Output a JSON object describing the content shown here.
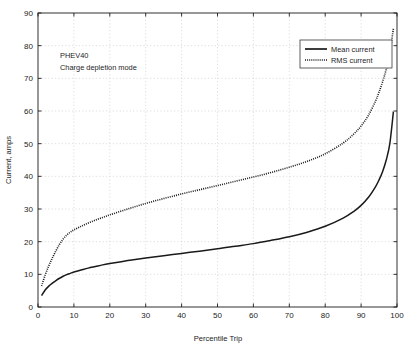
{
  "figure": {
    "background_color": "#ffffff",
    "axis_color": "#1c1c1c",
    "grid_color": "#c8c8c8",
    "series_color": "#1a1a1a"
  },
  "annotation": {
    "line1": "PHEV40",
    "line2": "Charge depletion mode"
  },
  "legend": {
    "position": "top-right",
    "entries": [
      {
        "label": "Mean current",
        "style": "solid"
      },
      {
        "label": "RMS current",
        "style": "dotted"
      }
    ]
  },
  "chart_data": {
    "type": "line",
    "title": "",
    "xlabel": "Percentile Trip",
    "ylabel": "Current, amps",
    "xlim": [
      0,
      100
    ],
    "ylim": [
      0,
      90
    ],
    "xticks": [
      0,
      10,
      20,
      30,
      40,
      50,
      60,
      70,
      80,
      90,
      100
    ],
    "yticks": [
      0,
      10,
      20,
      30,
      40,
      50,
      60,
      70,
      80,
      90
    ],
    "grid": true,
    "x": [
      1,
      2,
      3,
      4,
      5,
      6,
      7,
      8,
      9,
      10,
      12,
      14,
      16,
      18,
      20,
      25,
      30,
      35,
      40,
      45,
      50,
      55,
      60,
      65,
      70,
      75,
      80,
      85,
      88,
      90,
      92,
      94,
      95,
      96,
      97,
      98,
      99
    ],
    "series": [
      {
        "name": "Mean current",
        "style": "solid",
        "values": [
          3.5,
          5.2,
          6.4,
          7.3,
          8.1,
          8.8,
          9.4,
          9.9,
          10.3,
          10.7,
          11.3,
          11.9,
          12.4,
          12.9,
          13.3,
          14.2,
          15.0,
          15.7,
          16.4,
          17.1,
          17.8,
          18.6,
          19.4,
          20.4,
          21.5,
          22.9,
          24.7,
          27.2,
          29.3,
          31.1,
          33.5,
          36.8,
          38.9,
          41.5,
          45.0,
          50.0,
          59.8
        ]
      },
      {
        "name": "RMS current",
        "style": "dotted",
        "values": [
          6.4,
          9.8,
          12.6,
          15.0,
          17.2,
          19.2,
          20.8,
          22.0,
          22.9,
          23.6,
          24.7,
          25.7,
          26.6,
          27.4,
          28.2,
          30.0,
          31.7,
          33.2,
          34.6,
          35.9,
          37.2,
          38.5,
          39.8,
          41.2,
          42.8,
          44.6,
          46.9,
          50.2,
          53.0,
          55.4,
          58.6,
          63.0,
          65.8,
          69.0,
          72.8,
          78.0,
          85.2
        ]
      }
    ]
  }
}
